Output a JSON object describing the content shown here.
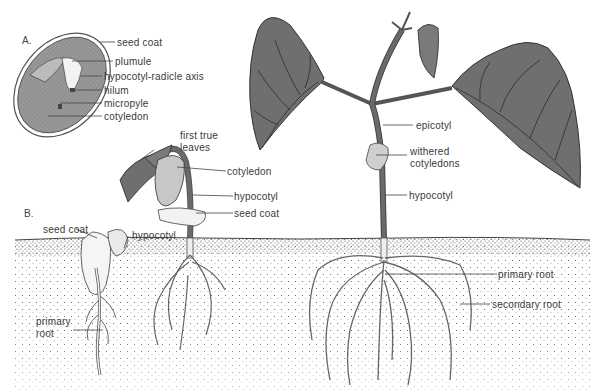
{
  "figure": {
    "colors": {
      "leaf": "#6f6f6f",
      "vein": "#333333",
      "seed_fill": "#8a8a8a",
      "soil_dot": "#555555",
      "stem": "#6a6a6a",
      "background": "#ffffff"
    }
  },
  "panels": [
    {
      "id": "A",
      "label": "A."
    },
    {
      "id": "B",
      "label": "B."
    }
  ],
  "labels_A": {
    "seed_coat": "seed coat",
    "plumule": "plumule",
    "hypocotyl_radicle_axis": "hypocotyl-radicle axis",
    "hilum": "hilum",
    "micropyle": "micropyle",
    "cotyledon": "cotyledon"
  },
  "labels_B": {
    "stage1": {
      "seed_coat": "seed coat",
      "hypocotyl": "hypocotyl",
      "primary_root_1": "primary",
      "primary_root_2": "root"
    },
    "stage2": {
      "first_true_leaves_1": "first true",
      "first_true_leaves_2": "leaves",
      "cotyledon": "cotyledon",
      "hypocotyl": "hypocotyl",
      "seed_coat": "seed coat"
    },
    "stage3": {
      "epicotyl": "epicotyl",
      "withered_cotyledons_1": "withered",
      "withered_cotyledons_2": "cotyledons",
      "hypocotyl": "hypocotyl",
      "primary_root": "primary root",
      "secondary_root": "secondary root"
    }
  }
}
